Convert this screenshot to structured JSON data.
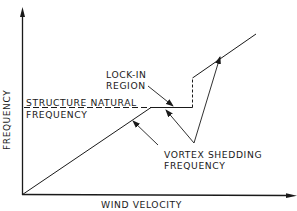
{
  "diagram": {
    "axes": {
      "x_label": "WIND VELOCITY",
      "y_label": "FREQUENCY"
    },
    "labels": {
      "structure_natural_line1": "STRUCTURE NATURAL",
      "structure_natural_line2": "FREQUENCY",
      "lock_in_line1": "LOCK-IN",
      "lock_in_line2": "REGION",
      "vortex_line1": "VORTEX SHEDDING",
      "vortex_line2": "FREQUENCY"
    },
    "colors": {
      "line": "#1a1a1a",
      "background": "#ffffff"
    }
  }
}
